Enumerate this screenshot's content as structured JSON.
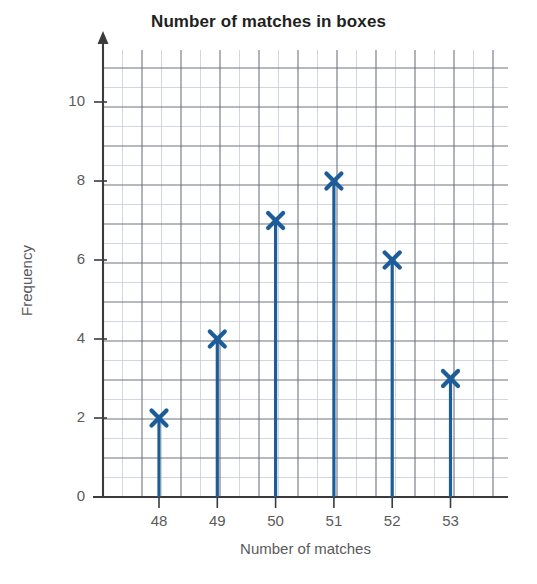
{
  "chart_data": {
    "type": "bar",
    "title": "Number of matches in boxes",
    "xlabel": "Number of matches",
    "ylabel": "Frequency",
    "categories": [
      "48",
      "49",
      "50",
      "51",
      "52",
      "53"
    ],
    "values": [
      2,
      4,
      7,
      8,
      6,
      3
    ],
    "x_tick_labels": [
      "48",
      "49",
      "50",
      "51",
      "52",
      "53"
    ],
    "y_tick_labels": [
      "0",
      "2",
      "4",
      "6",
      "8",
      "10"
    ],
    "y_tick_values": [
      0,
      2,
      4,
      6,
      8,
      10
    ],
    "ylim": [
      0,
      10.8
    ],
    "grid": "on",
    "grid_minor_step": 0.5,
    "grid_major_step": 1,
    "legend": "none",
    "marker": "x-cross",
    "series_color": "#1c5d99",
    "grid_minor_color": "#c5cdd6",
    "grid_major_color": "#6e757c",
    "axis_color": "#3b3b3d",
    "text_color": "#5a5a5c",
    "title_color": "#231f20"
  },
  "labels": {
    "title": "Number of matches in boxes",
    "x_axis": "Number of matches",
    "y_axis": "Frequency"
  }
}
